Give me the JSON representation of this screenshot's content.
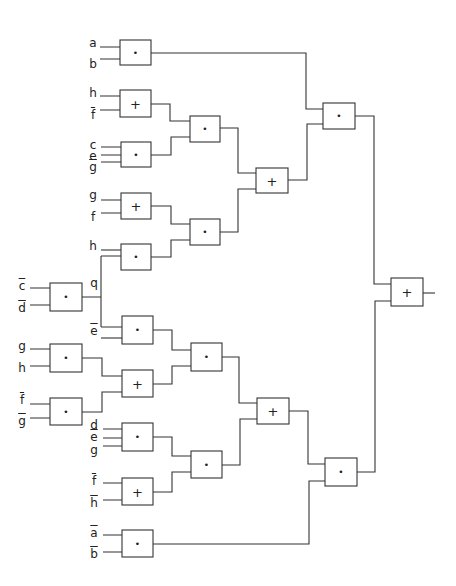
{
  "diagram": {
    "type": "logic-circuit",
    "symbols": {
      "and": "•",
      "or": "+"
    },
    "gates": [
      {
        "id": "g1",
        "op": "and",
        "x": 120,
        "y": 40,
        "w": 31,
        "h": 25
      },
      {
        "id": "g2",
        "op": "or",
        "x": 120,
        "y": 90,
        "w": 31,
        "h": 27
      },
      {
        "id": "g3",
        "op": "and",
        "x": 121,
        "y": 142,
        "w": 30,
        "h": 25
      },
      {
        "id": "g4",
        "op": "and",
        "x": 190,
        "y": 116,
        "w": 30,
        "h": 26
      },
      {
        "id": "g5",
        "op": "or",
        "x": 121,
        "y": 193,
        "w": 30,
        "h": 26
      },
      {
        "id": "g6",
        "op": "and",
        "x": 121,
        "y": 244,
        "w": 30,
        "h": 26
      },
      {
        "id": "g7",
        "op": "and",
        "x": 190,
        "y": 219,
        "w": 30,
        "h": 26
      },
      {
        "id": "g8",
        "op": "or",
        "x": 256,
        "y": 168,
        "w": 32,
        "h": 25
      },
      {
        "id": "g9",
        "op": "and",
        "x": 323,
        "y": 103,
        "w": 32,
        "h": 26
      },
      {
        "id": "g10",
        "op": "and",
        "x": 50,
        "y": 283,
        "w": 32,
        "h": 28
      },
      {
        "id": "g11",
        "op": "and",
        "x": 122,
        "y": 316,
        "w": 31,
        "h": 28
      },
      {
        "id": "g12",
        "op": "and",
        "x": 50,
        "y": 344,
        "w": 32,
        "h": 28
      },
      {
        "id": "g13",
        "op": "and",
        "x": 191,
        "y": 343,
        "w": 31,
        "h": 28
      },
      {
        "id": "g14",
        "op": "or",
        "x": 122,
        "y": 370,
        "w": 31,
        "h": 27
      },
      {
        "id": "g15",
        "op": "and",
        "x": 50,
        "y": 398,
        "w": 32,
        "h": 27
      },
      {
        "id": "g16",
        "op": "or",
        "x": 257,
        "y": 398,
        "w": 32,
        "h": 26
      },
      {
        "id": "g17",
        "op": "and",
        "x": 122,
        "y": 423,
        "w": 31,
        "h": 28
      },
      {
        "id": "g18",
        "op": "and",
        "x": 191,
        "y": 451,
        "w": 31,
        "h": 27
      },
      {
        "id": "g19",
        "op": "or",
        "x": 122,
        "y": 478,
        "w": 31,
        "h": 27
      },
      {
        "id": "g20",
        "op": "and",
        "x": 325,
        "y": 458,
        "w": 32,
        "h": 28
      },
      {
        "id": "g21",
        "op": "and",
        "x": 122,
        "y": 530,
        "w": 31,
        "h": 27
      },
      {
        "id": "g22",
        "op": "or",
        "x": 391,
        "y": 278,
        "w": 32,
        "h": 28
      }
    ],
    "labels": [
      {
        "text": "a",
        "bar": false,
        "x": 93,
        "y": 43
      },
      {
        "text": "b",
        "bar": false,
        "x": 93,
        "y": 64
      },
      {
        "text": "h",
        "bar": false,
        "x": 93,
        "y": 93
      },
      {
        "text": "f",
        "bar": true,
        "x": 93,
        "y": 115
      },
      {
        "text": "c",
        "bar": false,
        "x": 93,
        "y": 145
      },
      {
        "text": "e",
        "bar": false,
        "x": 93,
        "y": 156
      },
      {
        "text": "g",
        "bar": true,
        "x": 93,
        "y": 167
      },
      {
        "text": "g",
        "bar": false,
        "x": 93,
        "y": 195
      },
      {
        "text": "f",
        "bar": false,
        "x": 93,
        "y": 217
      },
      {
        "text": "h",
        "bar": false,
        "x": 93,
        "y": 246
      },
      {
        "text": "q",
        "bar": false,
        "x": 94,
        "y": 283
      },
      {
        "text": "c",
        "bar": true,
        "x": 22,
        "y": 286
      },
      {
        "text": "d",
        "bar": true,
        "x": 22,
        "y": 308
      },
      {
        "text": "e",
        "bar": true,
        "x": 94,
        "y": 331
      },
      {
        "text": "g",
        "bar": false,
        "x": 22,
        "y": 346
      },
      {
        "text": "h",
        "bar": false,
        "x": 22,
        "y": 368
      },
      {
        "text": "f",
        "bar": true,
        "x": 22,
        "y": 400
      },
      {
        "text": "g",
        "bar": true,
        "x": 22,
        "y": 421
      },
      {
        "text": "d",
        "bar": false,
        "x": 94,
        "y": 425
      },
      {
        "text": "e",
        "bar": true,
        "x": 94,
        "y": 437
      },
      {
        "text": "g",
        "bar": false,
        "x": 94,
        "y": 450
      },
      {
        "text": "f",
        "bar": true,
        "x": 94,
        "y": 481
      },
      {
        "text": "h",
        "bar": true,
        "x": 94,
        "y": 503
      },
      {
        "text": "a",
        "bar": true,
        "x": 94,
        "y": 533
      },
      {
        "text": "b",
        "bar": true,
        "x": 94,
        "y": 554
      }
    ]
  }
}
